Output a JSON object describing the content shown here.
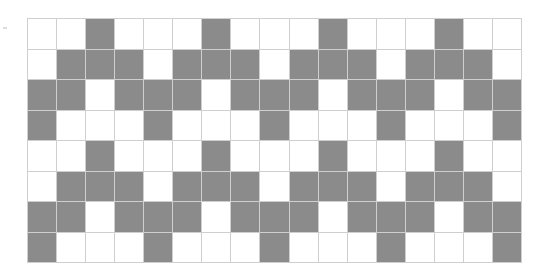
{
  "grid": {
    "rows": 8,
    "cols": 17,
    "filled_color": "#8b8b8b",
    "empty_color": "#ffffff",
    "line_color": "#cfcfcf",
    "cells": [
      [
        0,
        0,
        1,
        0,
        0,
        0,
        1,
        0,
        0,
        0,
        1,
        0,
        0,
        0,
        1,
        0,
        0
      ],
      [
        0,
        1,
        1,
        1,
        0,
        1,
        1,
        1,
        0,
        1,
        1,
        1,
        0,
        1,
        1,
        1,
        0
      ],
      [
        1,
        1,
        0,
        1,
        1,
        1,
        0,
        1,
        1,
        1,
        0,
        1,
        1,
        1,
        0,
        1,
        1
      ],
      [
        1,
        0,
        0,
        0,
        1,
        0,
        0,
        0,
        1,
        0,
        0,
        0,
        1,
        0,
        0,
        0,
        1
      ],
      [
        0,
        0,
        1,
        0,
        0,
        0,
        1,
        0,
        0,
        0,
        1,
        0,
        0,
        0,
        1,
        0,
        0
      ],
      [
        0,
        1,
        1,
        1,
        0,
        1,
        1,
        1,
        0,
        1,
        1,
        1,
        0,
        1,
        1,
        1,
        0
      ],
      [
        1,
        1,
        0,
        1,
        1,
        1,
        0,
        1,
        1,
        1,
        0,
        1,
        1,
        1,
        0,
        1,
        1
      ],
      [
        1,
        0,
        0,
        0,
        1,
        0,
        0,
        0,
        1,
        0,
        0,
        0,
        1,
        0,
        0,
        0,
        1
      ]
    ]
  }
}
